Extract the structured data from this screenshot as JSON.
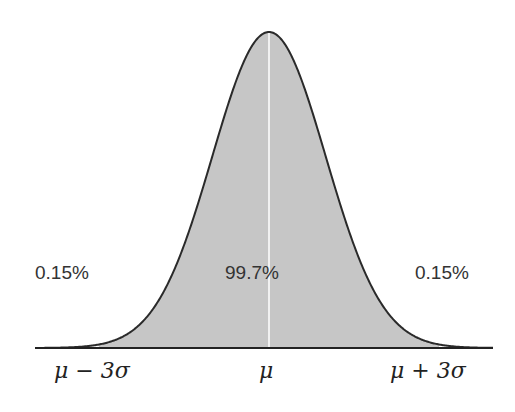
{
  "chart_data": {
    "type": "area",
    "title": "",
    "xlabel": "",
    "ylabel": "",
    "x_ticks": [
      "μ − 3σ",
      "μ",
      "μ + 3σ"
    ],
    "x_range_sigma": [
      -4,
      4
    ],
    "shaded_range_sigma": [
      -3,
      3
    ],
    "annotations": [
      {
        "text": "0.15%",
        "region": "left tail"
      },
      {
        "text": "99.7%",
        "region": "center"
      },
      {
        "text": "0.15%",
        "region": "right tail"
      }
    ],
    "series": [
      {
        "name": "normal-density",
        "mean": 0,
        "sd": 1
      }
    ],
    "grid": false,
    "legend": null
  },
  "colors": {
    "fill": "#c6c6c6",
    "curve": "#2a2a2a",
    "axis": "#222222",
    "mean_line": "#ffffff"
  },
  "labels": {
    "left_pct": "0.15%",
    "center_pct": "99.7%",
    "right_pct": "0.15%",
    "tick_left": "μ − 3σ",
    "tick_mid": "μ",
    "tick_right": "μ + 3σ"
  }
}
